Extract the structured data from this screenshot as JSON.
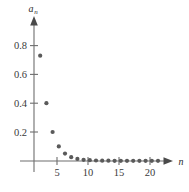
{
  "chart_data": {
    "type": "scatter",
    "title": "",
    "xlabel": "n",
    "ylabel": "a_n",
    "ylabel_base": "a",
    "ylabel_sub": "n",
    "xlim": [
      0,
      23.5
    ],
    "ylim": [
      0,
      0.93
    ],
    "grid": false,
    "legend": null,
    "xticks": [
      5,
      10,
      15,
      20
    ],
    "xtick_labels": [
      "5",
      "10",
      "15",
      "20"
    ],
    "yticks": [
      0.2,
      0.4,
      0.6,
      0.8
    ],
    "ytick_labels": [
      "0.2",
      "0.4",
      "0.6",
      "0.8"
    ],
    "marker": "filled-circle",
    "marker_color": "#5a5a5a",
    "axis_color": "#6e6e6e",
    "background_color": "#ffffff",
    "x": [
      1,
      2,
      3,
      4,
      5,
      6,
      7,
      8,
      9,
      10,
      11,
      12,
      13,
      14,
      15,
      16,
      17,
      18,
      19,
      20
    ],
    "values": [
      0.73,
      0.4,
      0.2,
      0.1,
      0.05,
      0.025,
      0.013,
      0.007,
      0.004,
      0.002,
      0.001,
      0.001,
      0.0,
      0.0,
      0.0,
      0.0,
      0.0,
      0.0,
      0.0,
      0.0
    ],
    "series": [
      {
        "name": "a_n",
        "x": [
          1,
          2,
          3,
          4,
          5,
          6,
          7,
          8,
          9,
          10,
          11,
          12,
          13,
          14,
          15,
          16,
          17,
          18,
          19,
          20
        ],
        "values": [
          0.73,
          0.4,
          0.2,
          0.1,
          0.05,
          0.025,
          0.013,
          0.007,
          0.004,
          0.002,
          0.001,
          0.001,
          0.0,
          0.0,
          0.0,
          0.0,
          0.0,
          0.0,
          0.0,
          0.0
        ]
      }
    ],
    "annotations": []
  },
  "figure": {
    "caption": ""
  }
}
